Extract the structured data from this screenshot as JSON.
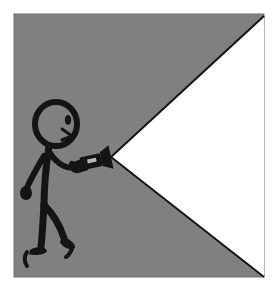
{
  "image": {
    "title": "Stick figure holding a flashlight",
    "description": "Black line-art stick figure walking to the right, holding a lit flashlight whose white conical beam widens across a gray background.",
    "style": "line-art",
    "width": 275,
    "height": 288
  },
  "canvas": {
    "outer_background": "#ffffff",
    "margin_left": 14,
    "margin_top": 14,
    "margin_right": 11,
    "margin_bottom": 11,
    "panel_x": 14,
    "panel_y": 14,
    "panel_width": 250,
    "panel_height": 263,
    "panel_background": "#808080",
    "panel_border_color": "#6e6e6e",
    "ink_color": "#141414",
    "beam_color": "#ffffff"
  },
  "beam": {
    "name": "flashlight-beam",
    "fill": "#ffffff",
    "outline": "#141414",
    "outline_width": 2,
    "apex_x": 111,
    "apex_y": 157,
    "top_edge_end_x": 264,
    "top_edge_end_y": 16,
    "bottom_edge_end_x": 264,
    "bottom_edge_end_y": 277,
    "shape": "wedge"
  },
  "flashlight": {
    "name": "flashlight",
    "body_fill": "#141414",
    "head_fill": "#141414",
    "switch_fill": "#b9b9b9",
    "angle_deg": -12,
    "tip_x": 111,
    "tip_y": 157,
    "grip_x": 80,
    "grip_y": 165
  },
  "figure": {
    "name": "stick-figure",
    "stroke": "#141414",
    "head": {
      "cx": 56,
      "cy": 124,
      "rx": 21,
      "ry": 22,
      "stroke_width": 6,
      "fill": "none"
    },
    "face": {
      "eye_cx": 68,
      "eye_cy": 120,
      "eye_rx": 3.2,
      "eye_ry": 5,
      "nose_points": "62,129 72,136 62,140",
      "direction": "facing-right"
    },
    "torso": {
      "path": "M 49 146 C 46 166, 44 186, 44 206",
      "stroke_width": 7
    },
    "arm_back": {
      "path": "M 44 156 C 36 170, 30 180, 27 188",
      "stroke_width": 6,
      "hand_cx": 26,
      "hand_cy": 193,
      "hand_rx": 6,
      "hand_ry": 7
    },
    "arm_front": {
      "path": "M 48 150 C 58 167, 70 170, 80 166",
      "stroke_width": 6
    },
    "leg_back": {
      "path": "M 44 204 C 43 222, 42 238, 41 247",
      "stroke_width": 7
    },
    "leg_front": {
      "path": "M 45 206 C 55 216, 60 226, 64 238",
      "stroke_width": 7
    },
    "foot_back": {
      "path": "M 30 250 C 38 245, 46 247, 47 251 C 45 255, 34 256, 29 254 Z",
      "heel_path": "M 27 252 C 24 256, 24 262, 27 266"
    },
    "foot_front": {
      "path": "M 62 236 C 70 239, 76 244, 75 248 C 70 251, 62 247, 60 242 Z",
      "heel_path": "M 72 249 C 70 253, 68 256, 66 257"
    }
  },
  "elements": [
    {
      "id": "panel",
      "label": "Gray background panel"
    },
    {
      "id": "beam",
      "label": "Flashlight light beam"
    },
    {
      "id": "figure",
      "label": "Stick figure"
    },
    {
      "id": "flashlight",
      "label": "Flashlight"
    }
  ]
}
